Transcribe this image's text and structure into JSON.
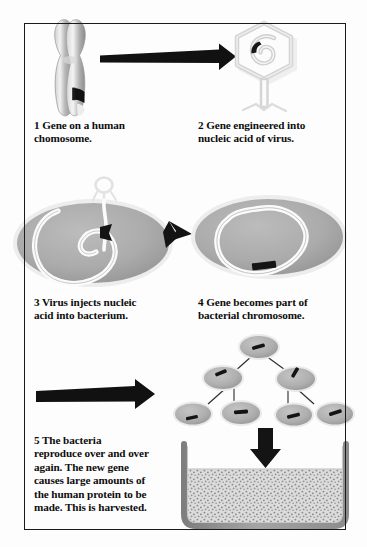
{
  "figure": {
    "border_color": "#1a1a1a",
    "background_color": "#ffffff"
  },
  "palette": {
    "ink": "#0d0d0d",
    "arrow_black": "#111111",
    "cell_gray": "#a9a9a9",
    "cell_gray_dark": "#8e8e8e",
    "cell_halo": "#e6e6e6",
    "chromosome_gray": "#b5b5b5",
    "virus_outline": "#d8d8d8",
    "vat_wall": "#9a9a9a",
    "medium_fill": "#d9d9d9",
    "speckle": "#8a8a8a",
    "dna_white": "#fbfbfb",
    "gene_black": "#101010"
  },
  "steps": [
    {
      "number": "1",
      "label": "1  Gene on a human\nchomosome.",
      "illustration": "human-chromosome-with-gene-band"
    },
    {
      "number": "2",
      "label": "2  Gene engineered into\nnucleic acid of virus.",
      "illustration": "bacteriophage-with-nucleic-acid-spiral"
    },
    {
      "number": "3",
      "label": "3  Virus injects nucleic\nacid into bacterium.",
      "illustration": "bacterium-with-virus-injecting-dna"
    },
    {
      "number": "4",
      "label": "4  Gene becomes part of\nbacterial chromosome.",
      "illustration": "bacterium-with-gene-in-chromosome"
    },
    {
      "number": "5",
      "label": "5  The bacteria\nreproduce over and over\nagain. The new gene\ncauses large amounts of\nthe human protein to be\nmade. This is harvested.",
      "illustration": "dividing-bacteria-tree-and-fermentation-vat"
    }
  ],
  "arrows": [
    {
      "name": "arrow-step1-to-step2",
      "direction": "right"
    },
    {
      "name": "arrow-step3-to-step4",
      "direction": "right"
    },
    {
      "name": "arrow-step4-to-step5",
      "direction": "right"
    },
    {
      "name": "arrow-bacteria-to-vat",
      "direction": "down"
    }
  ],
  "division_tree": {
    "generations": 3,
    "counts": [
      1,
      2,
      4
    ],
    "cell_label": "bacterium-with-gene"
  },
  "vat": {
    "name": "fermentation-vat",
    "contents": "speckled culture medium"
  }
}
